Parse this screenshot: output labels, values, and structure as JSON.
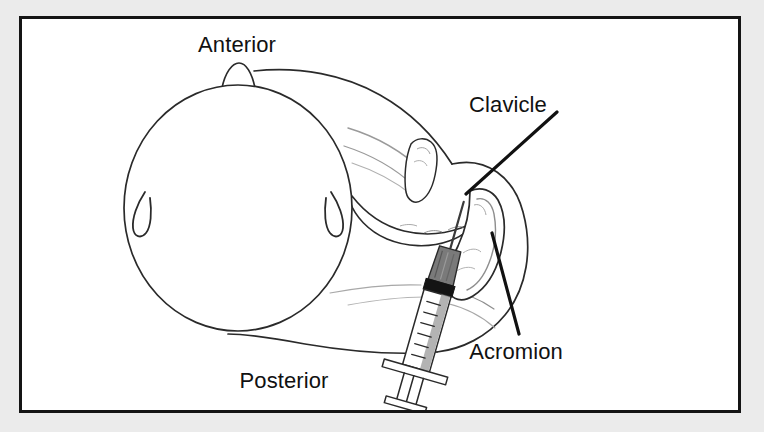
{
  "figure": {
    "kind": "medical-illustration",
    "view": "superior (top-down) view of head and shoulder",
    "panel": {
      "background_color": "#ebebeb",
      "page_color": "#ffffff",
      "border_color": "#111111",
      "line_color": "#1a1a1a"
    },
    "labels": {
      "anterior": "Anterior",
      "posterior": "Posterior",
      "clavicle": "Clavicle",
      "acromion": "Acromion"
    },
    "leader_lines": [
      {
        "name": "clavicle-leader",
        "from_label": "Clavicle",
        "to_structure": "clavicle bone"
      },
      {
        "name": "acromion-leader",
        "from_label": "Acromion",
        "to_structure": "acromion process"
      }
    ],
    "anatomy": [
      {
        "name": "skull",
        "description": "large oval outline of the head seen from above"
      },
      {
        "name": "nose",
        "description": "small bump at the top of the skull outline"
      },
      {
        "name": "ear-left",
        "description": "thin teardrop shape on left side of skull"
      },
      {
        "name": "ear-right",
        "description": "thin teardrop shape on right side of skull"
      },
      {
        "name": "clavicle",
        "description": "S-curved collarbone running from neck to shoulder"
      },
      {
        "name": "acromion",
        "description": "hooked bony process at the lateral tip of the shoulder"
      },
      {
        "name": "shoulder-contour",
        "description": "outline of the deltoid and upper arm"
      },
      {
        "name": "torso-contour",
        "description": "outline of the neck, trapezius and back"
      }
    ],
    "instrument": {
      "name": "syringe",
      "parts": [
        "needle",
        "needle-hub",
        "barrel",
        "graduation-marks",
        "plunger-stopper",
        "finger-flange",
        "plunger-rod",
        "thumb-press"
      ],
      "hub_color": "#6e6e6e",
      "stopper_color": "#1a1a1a",
      "barrel_color": "#ffffff",
      "angle_degrees": 16
    }
  }
}
